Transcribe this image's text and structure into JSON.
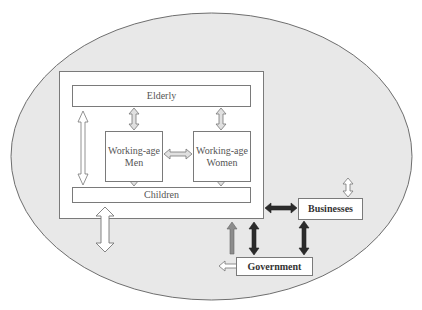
{
  "diagram": {
    "type": "flow-diagram",
    "colors": {
      "background_ellipse": "#e8e8e8",
      "ellipse_stroke": "#6e6e6e",
      "box_fill": "#ffffff",
      "box_stroke": "#7a7a7a",
      "arrow_light": "#e0e0e0",
      "arrow_dark": "#2b2b2b",
      "arrow_gray": "#8c8c8c"
    },
    "nodes": {
      "elderly": "Elderly",
      "men_line1": "Working-age",
      "men_line2": "Men",
      "women_line1": "Working-age",
      "women_line2": "Women",
      "children": "Children",
      "businesses": "Businesses",
      "government": "Government"
    },
    "edges": [
      {
        "from": "Elderly",
        "to": "Working-age Men",
        "style": "light-double"
      },
      {
        "from": "Elderly",
        "to": "Working-age Women",
        "style": "light-double"
      },
      {
        "from": "Working-age Men",
        "to": "Working-age Women",
        "style": "light-double"
      },
      {
        "from": "Working-age Men",
        "to": "Children",
        "style": "light-double"
      },
      {
        "from": "Working-age Women",
        "to": "Children",
        "style": "light-double"
      },
      {
        "from": "Elderly",
        "to": "Children",
        "style": "white-double"
      },
      {
        "from": "Household",
        "to": "Outside",
        "style": "white-double"
      },
      {
        "from": "Household",
        "to": "Businesses",
        "style": "dark-double"
      },
      {
        "from": "Household",
        "to": "Government",
        "style": "dark-double"
      },
      {
        "from": "Government",
        "to": "Household",
        "style": "gray-single"
      },
      {
        "from": "Businesses",
        "to": "Government",
        "style": "dark-double"
      },
      {
        "from": "Businesses",
        "to": "Outside",
        "style": "white-double"
      },
      {
        "from": "Government",
        "to": "Outside",
        "style": "white-double"
      }
    ]
  }
}
